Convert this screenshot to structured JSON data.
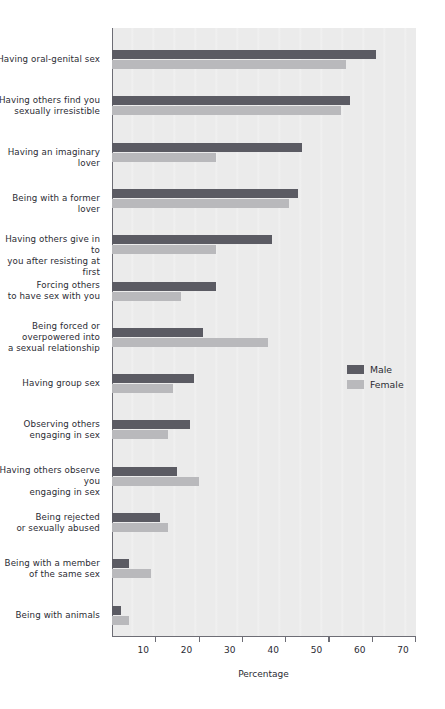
{
  "chart_data": {
    "type": "bar",
    "orientation": "horizontal",
    "title": "",
    "xlabel": "Percentage",
    "ylabel": "",
    "xlim": [
      0,
      70
    ],
    "xticks": [
      10,
      20,
      30,
      40,
      50,
      60,
      70
    ],
    "xtick_labels": [
      "10",
      "20",
      "30",
      "40",
      "50",
      "60",
      "70"
    ],
    "grid": false,
    "legend_position": "middle-right",
    "categories": [
      "Having oral-genital sex",
      "Having others find you\nsexually irresistible",
      "Having an imaginary lover",
      "Being with a former lover",
      "Having others give in to\nyou after resisting at first",
      "Forcing others\nto have sex with you",
      "Being forced or\noverpowered into\na sexual relationship",
      "Having group sex",
      "Observing others\nengaging in sex",
      "Having others observe you\nengaging in sex",
      "Being rejected\nor sexually abused",
      "Being with a member\nof the same sex",
      "Being with animals"
    ],
    "series": [
      {
        "name": "Male",
        "color": "#5b5b63",
        "values": [
          61,
          55,
          44,
          43,
          37,
          24,
          21,
          19,
          18,
          15,
          11,
          4,
          2
        ]
      },
      {
        "name": "Female",
        "color": "#b9b9bc",
        "values": [
          54,
          53,
          24,
          41,
          24,
          16,
          36,
          14,
          13,
          20,
          13,
          9,
          4
        ]
      }
    ]
  },
  "legend": {
    "items": [
      {
        "label": "Male",
        "color": "#5b5b63"
      },
      {
        "label": "Female",
        "color": "#b9b9bc"
      }
    ]
  },
  "axis": {
    "x_title": "Percentage"
  },
  "colors": {
    "male": "#5b5b63",
    "female": "#b9b9bc",
    "panel_background": "#ebebeb",
    "axis_line": "#6d6d75",
    "text": "#2b2b33"
  }
}
